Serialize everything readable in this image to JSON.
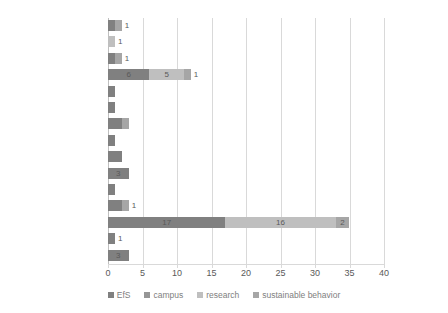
{
  "chart_data": {
    "type": "bar",
    "orientation": "horizontal",
    "stacked": true,
    "title": "",
    "xlabel": "",
    "ylabel": "",
    "xlim": [
      0,
      40
    ],
    "xticks": [
      0,
      5,
      10,
      15,
      20,
      25,
      30,
      35,
      40
    ],
    "grid": true,
    "legend_position": "bottom",
    "categories": [
      "Venezuela",
      "Uruguay",
      "Paraguay",
      "Mexico",
      "Honduras",
      "Guatemala",
      "El Salvador",
      "Dominican Republic",
      "Cuba",
      "Costa Rica",
      "Colombia",
      "Chile",
      "Brazil",
      "Bolivia",
      "Argentina"
    ],
    "series": [
      {
        "name": "EfS",
        "color": "#808080",
        "values": [
          1,
          0,
          1,
          6,
          1,
          1,
          2,
          1,
          2,
          3,
          1,
          2,
          17,
          1,
          3
        ]
      },
      {
        "name": "campus",
        "color": "#969696",
        "values": [
          0,
          0,
          0,
          0,
          0,
          0,
          0,
          0,
          0,
          0,
          0,
          0,
          0,
          0,
          0
        ]
      },
      {
        "name": "research",
        "color": "#bfbfbf",
        "values": [
          0,
          1,
          0,
          5,
          0,
          0,
          0,
          0,
          0,
          0,
          0,
          0,
          16,
          0,
          0
        ]
      },
      {
        "name": "sustainable behavior",
        "color": "#a6a6a6",
        "values": [
          1,
          0,
          1,
          1,
          0,
          0,
          1,
          0,
          0,
          0,
          0,
          1,
          2,
          0,
          0
        ]
      }
    ],
    "bar_labels": [
      {
        "category": "Venezuela",
        "labels": [
          "",
          "",
          "",
          "1"
        ]
      },
      {
        "category": "Uruguay",
        "labels": [
          "",
          "",
          "1",
          ""
        ]
      },
      {
        "category": "Paraguay",
        "labels": [
          "",
          "",
          "",
          "1"
        ]
      },
      {
        "category": "Mexico",
        "labels": [
          "6",
          "",
          "5",
          "1"
        ]
      },
      {
        "category": "Honduras",
        "labels": [
          "",
          "",
          "",
          ""
        ]
      },
      {
        "category": "Guatemala",
        "labels": [
          "",
          "",
          "",
          ""
        ]
      },
      {
        "category": "El Salvador",
        "labels": [
          "",
          "",
          "",
          ""
        ]
      },
      {
        "category": "Dominican Republic",
        "labels": [
          "",
          "",
          "",
          ""
        ]
      },
      {
        "category": "Cuba",
        "labels": [
          "",
          "",
          "",
          ""
        ]
      },
      {
        "category": "Costa Rica",
        "labels": [
          "3",
          "",
          "",
          ""
        ]
      },
      {
        "category": "Colombia",
        "labels": [
          "",
          "",
          "",
          ""
        ]
      },
      {
        "category": "Chile",
        "labels": [
          "",
          "",
          "",
          "1"
        ]
      },
      {
        "category": "Brazil",
        "labels": [
          "17",
          "",
          "16",
          "2"
        ]
      },
      {
        "category": "Bolivia",
        "labels": [
          "1",
          "",
          "",
          ""
        ]
      },
      {
        "category": "Argentina",
        "labels": [
          "3",
          "",
          "",
          ""
        ]
      }
    ]
  }
}
